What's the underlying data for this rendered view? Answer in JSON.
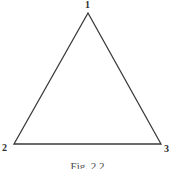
{
  "figure": {
    "caption": "Fig. 2.2",
    "background_color": "#ffffff",
    "stroke_color": "#3a3a3a",
    "label_color": "#2e2e2e",
    "shape": {
      "type": "triangle",
      "stroke_width": 1.3,
      "vertices": [
        {
          "id": "1",
          "label": "1",
          "x": 88,
          "y": 13,
          "position": "apex"
        },
        {
          "id": "2",
          "label": "2",
          "x": 14,
          "y": 144,
          "position": "bottom-left"
        },
        {
          "id": "3",
          "label": "3",
          "x": 161,
          "y": 144,
          "position": "bottom-right"
        }
      ],
      "edges": [
        {
          "from": "1",
          "to": "2"
        },
        {
          "from": "2",
          "to": "3"
        },
        {
          "from": "3",
          "to": "1"
        }
      ]
    },
    "labels": {
      "apex": "1",
      "bottom_left": "2",
      "bottom_right": "3"
    }
  }
}
